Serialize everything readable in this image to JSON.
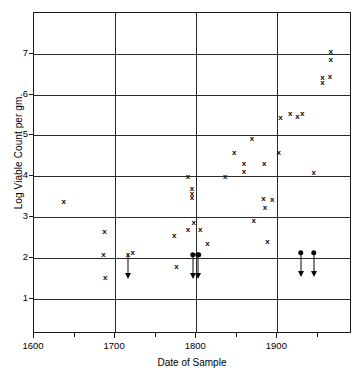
{
  "chart_data": {
    "type": "scatter",
    "title": "",
    "xlabel": "Date of Sample",
    "ylabel": "Log Viable Count per gm.",
    "xlim": [
      1600,
      1992
    ],
    "ylim": [
      0.13,
      8.0
    ],
    "grid": true,
    "legend": null,
    "x_ticks_major": [
      1600,
      1700,
      1800,
      1900
    ],
    "x_ticks_major_labels": [
      "1600",
      "1700",
      "1800",
      "1900"
    ],
    "x_ticks_minor": [
      1650,
      1750,
      1850,
      1950
    ],
    "y_ticks": [
      1,
      2,
      3,
      4,
      5,
      6,
      7
    ],
    "y_tick_labels": [
      "1",
      "2",
      "3",
      "4",
      "5",
      "6",
      "7"
    ],
    "marker_styles": {
      "detected": "x",
      "below_detection_limit": "filled-circle-with-down-arrow"
    },
    "series": [
      {
        "name": "Viable counts (x marks)",
        "marker": "x",
        "points": [
          {
            "x": 1638,
            "y": 3.35
          },
          {
            "x": 1688,
            "y": 2.6
          },
          {
            "x": 1687,
            "y": 2.05
          },
          {
            "x": 1689,
            "y": 1.48
          },
          {
            "x": 1723,
            "y": 2.1
          },
          {
            "x": 1774,
            "y": 2.5
          },
          {
            "x": 1777,
            "y": 1.75
          },
          {
            "x": 1791,
            "y": 3.95
          },
          {
            "x": 1796,
            "y": 3.65
          },
          {
            "x": 1796,
            "y": 3.55
          },
          {
            "x": 1796,
            "y": 3.45
          },
          {
            "x": 1798,
            "y": 2.82
          },
          {
            "x": 1791,
            "y": 2.65
          },
          {
            "x": 1806,
            "y": 2.65
          },
          {
            "x": 1815,
            "y": 2.32
          },
          {
            "x": 1837,
            "y": 3.95
          },
          {
            "x": 1848,
            "y": 4.55
          },
          {
            "x": 1860,
            "y": 4.28
          },
          {
            "x": 1860,
            "y": 4.08
          },
          {
            "x": 1870,
            "y": 4.88
          },
          {
            "x": 1872,
            "y": 2.88
          },
          {
            "x": 1884,
            "y": 3.42
          },
          {
            "x": 1886,
            "y": 3.2
          },
          {
            "x": 1885,
            "y": 4.28
          },
          {
            "x": 1889,
            "y": 2.35
          },
          {
            "x": 1895,
            "y": 3.4
          },
          {
            "x": 1903,
            "y": 4.55
          },
          {
            "x": 1905,
            "y": 5.4
          },
          {
            "x": 1917,
            "y": 5.5
          },
          {
            "x": 1926,
            "y": 5.42
          },
          {
            "x": 1932,
            "y": 5.5
          },
          {
            "x": 1946,
            "y": 4.05
          },
          {
            "x": 1957,
            "y": 6.38
          },
          {
            "x": 1957,
            "y": 6.25
          },
          {
            "x": 1966,
            "y": 6.4
          },
          {
            "x": 1967,
            "y": 7.02
          },
          {
            "x": 1967,
            "y": 6.82
          }
        ]
      },
      {
        "name": "Below detection limit (arrows)",
        "marker": "arrow-down",
        "points": [
          {
            "x": 1717,
            "y": 2.05,
            "arrow_to": 1.45,
            "head": "x"
          },
          {
            "x": 1797,
            "y": 2.05,
            "arrow_to": 1.45,
            "head": "dot"
          },
          {
            "x": 1804,
            "y": 2.05,
            "arrow_to": 1.45,
            "head": "dot"
          },
          {
            "x": 1930,
            "y": 2.1,
            "arrow_to": 1.5,
            "head": "dot"
          },
          {
            "x": 1946,
            "y": 2.1,
            "arrow_to": 1.5,
            "head": "dot"
          }
        ]
      }
    ]
  }
}
